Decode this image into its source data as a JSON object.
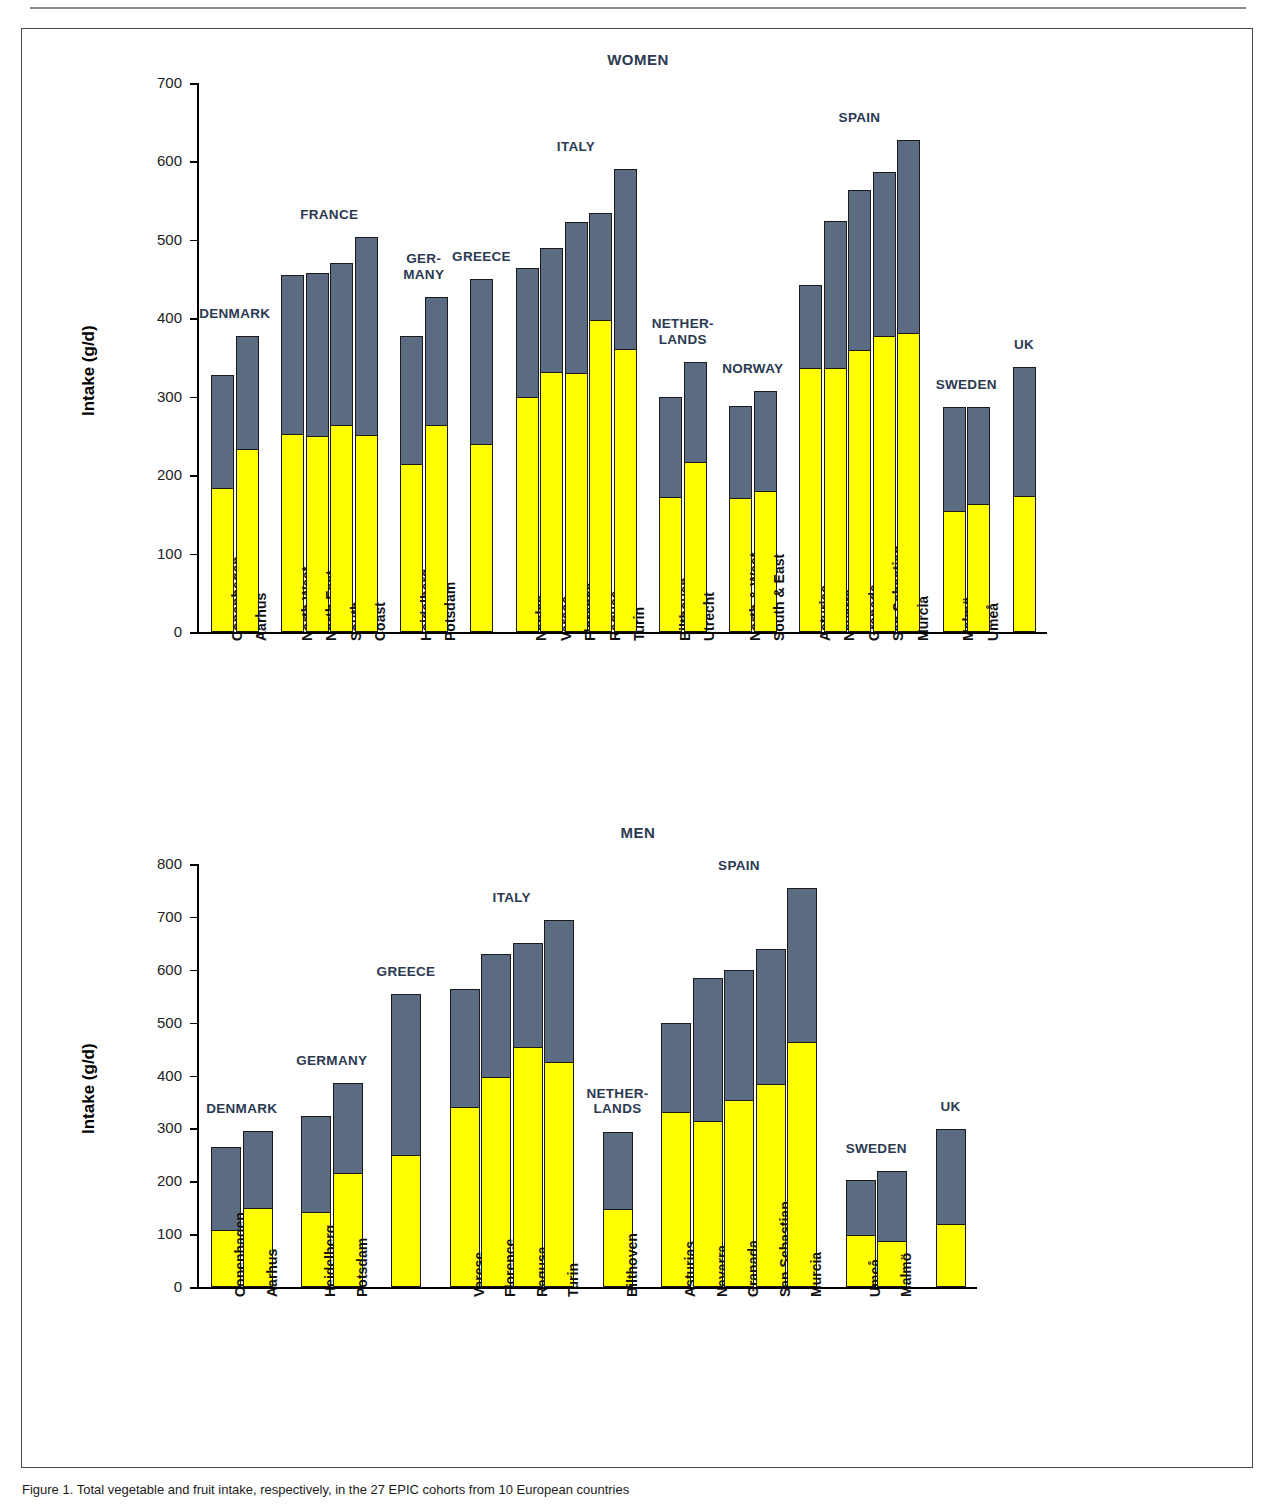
{
  "figure": {
    "caption": "Figure 1. Total vegetable and fruit intake, respectively, in the 27 EPIC cohorts from 10 European countries"
  },
  "chart_data": [
    {
      "id": "women",
      "type": "bar",
      "subtype": "stacked",
      "title": "WOMEN",
      "ylabel": "Intake (g/d)",
      "xlabel": "",
      "ylim": [
        0,
        700
      ],
      "yticks": [
        0,
        100,
        200,
        300,
        400,
        500,
        600,
        700
      ],
      "grid": false,
      "legend": "none",
      "series": [
        {
          "name": "vegetables",
          "color": "#ffff00"
        },
        {
          "name": "fruit",
          "color": "#5a6b82"
        }
      ],
      "groups": [
        {
          "country": "DENMARK",
          "categories": [
            "Copenhagen",
            "Aarhus"
          ],
          "bottom": [
            182,
            232
          ],
          "total": [
            328,
            378
          ]
        },
        {
          "country": "FRANCE",
          "categories": [
            "North West",
            "North East",
            "South",
            "Coast"
          ],
          "bottom": [
            251,
            249,
            263,
            250
          ],
          "total": [
            455,
            458,
            470,
            504
          ]
        },
        {
          "country": "GER-\nMANY",
          "categories": [
            "Heidelberg",
            "Potsdam"
          ],
          "bottom": [
            213,
            263
          ],
          "total": [
            377,
            427
          ]
        },
        {
          "country": "GREECE",
          "categories": [
            ""
          ],
          "bottom": [
            239
          ],
          "total": [
            450
          ]
        },
        {
          "country": "ITALY",
          "categories": [
            "Naples",
            "Varese",
            "Florence",
            "Ragusa",
            "Turin"
          ],
          "bottom": [
            298,
            330,
            329,
            397,
            359
          ],
          "total": [
            464,
            489,
            523,
            534,
            590
          ]
        },
        {
          "country": "NETHER-\nLANDS",
          "categories": [
            "Bilthoven",
            "Utrecht"
          ],
          "bottom": [
            171,
            215
          ],
          "total": [
            300,
            344
          ]
        },
        {
          "country": "NORWAY",
          "categories": [
            "North & West",
            "South & East"
          ],
          "bottom": [
            169,
            179
          ],
          "total": [
            288,
            307
          ]
        },
        {
          "country": "SPAIN",
          "categories": [
            "Asturias",
            "Navarra",
            "Granada",
            "San Sebastian",
            "Murcia"
          ],
          "bottom": [
            335,
            335,
            358,
            376,
            380
          ],
          "total": [
            442,
            524,
            563,
            586,
            627
          ]
        },
        {
          "country": "SWEDEN",
          "categories": [
            "Malmö",
            "Umeå"
          ],
          "bottom": [
            153,
            162
          ],
          "total": [
            287,
            287
          ]
        },
        {
          "country": "UK",
          "categories": [
            ""
          ],
          "bottom": [
            172
          ],
          "total": [
            338
          ]
        }
      ]
    },
    {
      "id": "men",
      "type": "bar",
      "subtype": "stacked",
      "title": "MEN",
      "ylabel": "Intake (g/d)",
      "xlabel": "",
      "ylim": [
        0,
        800
      ],
      "yticks": [
        0,
        100,
        200,
        300,
        400,
        500,
        600,
        700,
        800
      ],
      "grid": false,
      "legend": "none",
      "series": [
        {
          "name": "vegetables",
          "color": "#ffff00"
        },
        {
          "name": "fruit",
          "color": "#5a6b82"
        }
      ],
      "groups": [
        {
          "country": "DENMARK",
          "categories": [
            "Copenhagen",
            "Aarhus"
          ],
          "bottom": [
            106,
            148
          ],
          "total": [
            264,
            295
          ]
        },
        {
          "country": "GERMANY",
          "categories": [
            "Heidelberg",
            "Potsdam"
          ],
          "bottom": [
            140,
            213
          ],
          "total": [
            323,
            386
          ]
        },
        {
          "country": "GREECE",
          "categories": [
            ""
          ],
          "bottom": [
            248
          ],
          "total": [
            554
          ]
        },
        {
          "country": "ITALY",
          "categories": [
            "Varese",
            "Florence",
            "Ragusa",
            "Turin"
          ],
          "bottom": [
            338,
            396,
            452,
            423
          ],
          "total": [
            564,
            629,
            650,
            694
          ]
        },
        {
          "country": "NETHER-\nLANDS",
          "categories": [
            "Bilthoven"
          ],
          "bottom": [
            145
          ],
          "total": [
            294
          ]
        },
        {
          "country": "SPAIN",
          "categories": [
            "Asturias",
            "Navarra",
            "Granada",
            "San Sebastian",
            "Murcia"
          ],
          "bottom": [
            329,
            312,
            352,
            382,
            462
          ],
          "total": [
            499,
            585,
            600,
            639,
            754
          ]
        },
        {
          "country": "SWEDEN",
          "categories": [
            "Umeå",
            "Malmö"
          ],
          "bottom": [
            96,
            85
          ],
          "total": [
            203,
            219
          ]
        },
        {
          "country": "UK",
          "categories": [
            ""
          ],
          "bottom": [
            117
          ],
          "total": [
            299
          ]
        }
      ]
    }
  ]
}
